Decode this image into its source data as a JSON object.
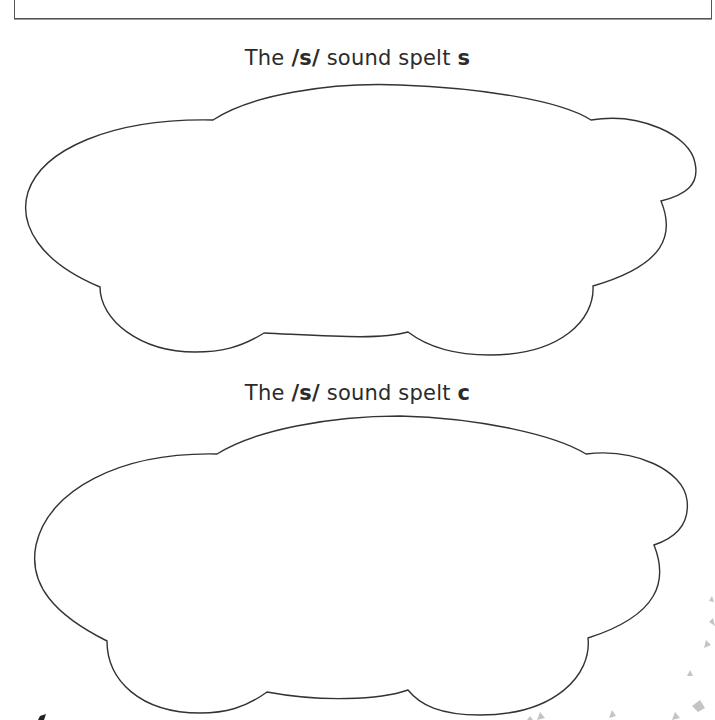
{
  "worksheet": {
    "sections": [
      {
        "heading_prefix": "The ",
        "phoneme": "/s/",
        "heading_middle": " sound spelt ",
        "grapheme": "s",
        "answer_area": "cloud"
      },
      {
        "heading_prefix": "The ",
        "phoneme": "/s/",
        "heading_middle": " sound spelt ",
        "grapheme": "c",
        "answer_area": "cloud"
      }
    ]
  },
  "colors": {
    "background": "#ffffff",
    "outline": "#333333",
    "text": "#2b2b2b",
    "decoration": "#bbbbbb"
  }
}
